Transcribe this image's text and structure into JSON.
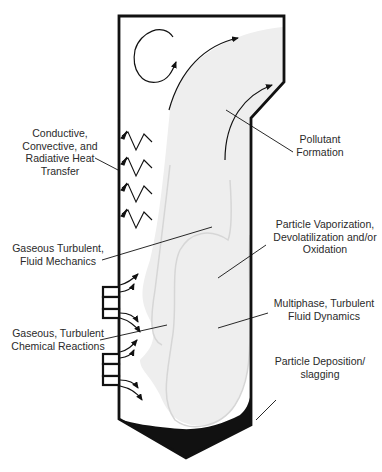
{
  "diagram": {
    "type": "furnace-process-schematic",
    "colors": {
      "wall": "#111111",
      "flame": "#eeeeee",
      "flame_outline": "#d6d6d6",
      "deposit": "#111111",
      "text": "#2a2a2a"
    },
    "labels": {
      "heat_transfer": "Conductive,\nConvective, and\nRadiative Heat\nTransfer",
      "pollutant": "Pollutant\nFormation",
      "fluid_mechanics": "Gaseous Turbulent,\nFluid Mechanics",
      "vaporization": "Particle Vaporization,\nDevolatilization and/or\nOxidation",
      "multiphase": "Multiphase, Turbulent\nFluid Dynamics",
      "chemical_reactions": "Gaseous, Turbulent\nChemical Reactions",
      "deposition": "Particle Deposition/\nslagging"
    }
  }
}
